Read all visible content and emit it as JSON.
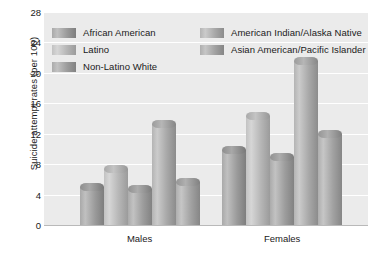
{
  "chart_data": {
    "type": "bar",
    "title": "",
    "xlabel": "",
    "ylabel": "Suicide attempt rates (per 100)",
    "categories": [
      "Males",
      "Females"
    ],
    "ylim": [
      0,
      28
    ],
    "yticks": [
      0,
      4,
      8,
      12,
      16,
      20,
      24,
      28
    ],
    "ytick_labels": [
      "0",
      "4",
      "8",
      "12",
      "16",
      "20",
      "24",
      "28"
    ],
    "grid": true,
    "legend_position": "top-inside",
    "series": [
      {
        "name": "African American",
        "values": [
          5.0,
          9.8
        ],
        "color": "#a0a0a0"
      },
      {
        "name": "Latino",
        "values": [
          7.3,
          14.3
        ],
        "color": "#c4c4c4"
      },
      {
        "name": "Non-Latino White",
        "values": [
          4.8,
          9.0
        ],
        "color": "#a5a5a5"
      },
      {
        "name": "American Indian/Alaska Native",
        "values": [
          13.3,
          21.5
        ],
        "color": "#b0b0b0"
      },
      {
        "name": "Asian American/Pacific Islander",
        "values": [
          5.7,
          12.0
        ],
        "color": "#aaaaaa"
      }
    ]
  },
  "axis": {
    "y_title": "Suicide attempt rates (per 100)",
    "tick_28": "28",
    "tick_24": "24",
    "tick_20": "20",
    "tick_16": "16",
    "tick_12": "12",
    "tick_8": "8",
    "tick_4": "4",
    "tick_0": "0"
  },
  "legend": {
    "left_column": [
      {
        "label": "African American"
      },
      {
        "label": "Latino"
      },
      {
        "label": "Non-Latino White"
      }
    ],
    "right_column": [
      {
        "label": "American Indian/Alaska Native"
      },
      {
        "label": "Asian American/Pacific Islander"
      }
    ]
  },
  "x_categories": {
    "males": "Males",
    "females": "Females"
  },
  "colors": {
    "plot_background": "#ebebeb",
    "gridline": "#ffffff",
    "axis_line": "#b9b9b9",
    "text": "#1a1a1a",
    "page_background": "#ffffff"
  }
}
